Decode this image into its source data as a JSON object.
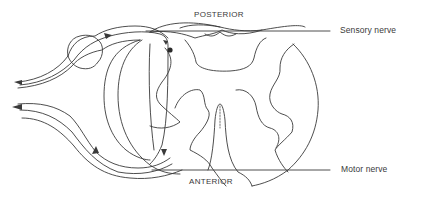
{
  "diagram": {
    "type": "spinal cord reflex arc cross-section",
    "labels": {
      "posterior": "POSTERIOR",
      "anterior": "ANTERIOR",
      "sensory_nerve": "Sensory nerve",
      "motor_nerve": "Motor nerve"
    },
    "colors": {
      "line": "#3a3a3a",
      "background": "#ffffff"
    }
  }
}
